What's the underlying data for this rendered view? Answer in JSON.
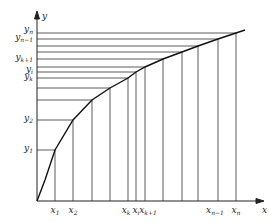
{
  "figure": {
    "axes": {
      "x_label": "x",
      "y_label": "y"
    },
    "y_labels": [
      {
        "base": "y",
        "sub": "n",
        "y": 32
      },
      {
        "base": "y",
        "sub": "n−1",
        "y": 40
      },
      {
        "base": "y",
        "sub": "k+1",
        "y": 60
      },
      {
        "base": "y",
        "sub": "i",
        "y": 72
      },
      {
        "base": "y",
        "sub": "k",
        "y": 79
      },
      {
        "base": "y",
        "sub": "2",
        "y": 121
      },
      {
        "base": "y",
        "sub": "1",
        "y": 151
      }
    ],
    "x_labels": [
      {
        "base": "x",
        "sub": "1",
        "x": 55
      },
      {
        "base": "x",
        "sub": "2",
        "x": 73
      },
      {
        "base": "x",
        "sub": "k",
        "x": 126
      },
      {
        "base": "x",
        "sub": "i",
        "x": 136
      },
      {
        "base": "x",
        "sub": "k+1",
        "x": 148
      },
      {
        "base": "x",
        "sub": "n−1",
        "x": 215
      },
      {
        "base": "x",
        "sub": "n",
        "x": 236
      }
    ],
    "curve_points": [
      [
        37,
        201
      ],
      [
        45,
        180
      ],
      [
        55,
        150
      ],
      [
        73,
        120
      ],
      [
        92,
        100
      ],
      [
        110,
        88
      ],
      [
        128,
        78
      ],
      [
        136,
        72
      ],
      [
        145,
        67
      ],
      [
        163,
        59
      ],
      [
        182,
        52
      ],
      [
        198,
        46
      ],
      [
        218,
        39
      ],
      [
        236,
        33
      ],
      [
        245,
        30
      ]
    ],
    "vertical_lines_x": [
      55,
      73,
      92,
      110,
      128,
      136,
      145,
      163,
      182,
      198,
      218,
      236
    ],
    "horizontal_lines_y": [
      33,
      39,
      46,
      52,
      59,
      67,
      72,
      78,
      88,
      100,
      120,
      150
    ]
  }
}
